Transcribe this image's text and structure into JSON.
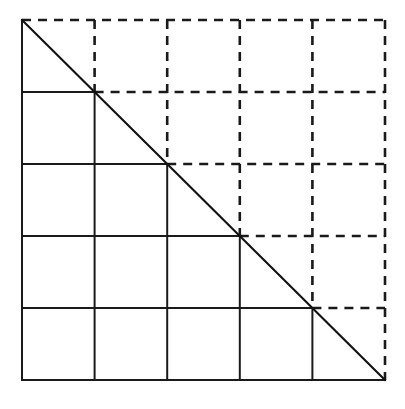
{
  "figure": {
    "kind": "geometric-diagram",
    "canvas": {
      "width": 405,
      "height": 409,
      "background": "#ffffff"
    },
    "square": {
      "x0": 22,
      "y0": 20,
      "x1": 385,
      "y1": 380,
      "width": 363,
      "height": 360
    },
    "grid": {
      "rows": 5,
      "columns": 5,
      "x_positions": [
        22,
        94.6,
        167.2,
        239.8,
        312.4,
        385
      ],
      "y_positions": [
        20,
        92,
        164,
        236,
        308,
        380
      ],
      "cell_width": 72.6,
      "cell_height": 72
    },
    "diagonal": {
      "name": "anti-diagonal",
      "from": [
        22,
        20
      ],
      "to": [
        385,
        380
      ],
      "style": "solid",
      "color": "#111111",
      "width": 2.1
    },
    "styles": {
      "solid": {
        "label": "solid",
        "color": "#1a1a1a",
        "width": 2.0,
        "dash": "none"
      },
      "dashed": {
        "label": "dashed",
        "color": "#1a1a1a",
        "width": 2.6,
        "dash": "9 7"
      }
    },
    "rule": "Segments on or below-left of the anti-diagonal are drawn solid; segments above-right of the anti-diagonal are drawn dashed.",
    "edges": {
      "left": "solid",
      "bottom": "solid",
      "top": "dashed",
      "right": "dashed"
    },
    "vertical_lines": [
      {
        "x": 22,
        "solid_from_y": 20,
        "solid_to_y": 380,
        "dashed_from_y": null,
        "dashed_to_y": null
      },
      {
        "x": 94.6,
        "solid_from_y": 92,
        "solid_to_y": 380,
        "dashed_from_y": 20,
        "dashed_to_y": 92
      },
      {
        "x": 167.2,
        "solid_from_y": 164,
        "solid_to_y": 380,
        "dashed_from_y": 20,
        "dashed_to_y": 164
      },
      {
        "x": 239.8,
        "solid_from_y": 236,
        "solid_to_y": 380,
        "dashed_from_y": 20,
        "dashed_to_y": 236
      },
      {
        "x": 312.4,
        "solid_from_y": 308,
        "solid_to_y": 380,
        "dashed_from_y": 20,
        "dashed_to_y": 308
      },
      {
        "x": 385,
        "solid_from_y": null,
        "solid_to_y": null,
        "dashed_from_y": 20,
        "dashed_to_y": 380
      }
    ],
    "horizontal_lines": [
      {
        "y": 20,
        "solid_from_x": null,
        "solid_to_x": null,
        "dashed_from_x": 22,
        "dashed_to_x": 385
      },
      {
        "y": 92,
        "solid_from_x": 22,
        "solid_to_x": 94.6,
        "dashed_from_x": 94.6,
        "dashed_to_x": 385
      },
      {
        "y": 164,
        "solid_from_x": 22,
        "solid_to_x": 167.2,
        "dashed_from_x": 167.2,
        "dashed_to_x": 385
      },
      {
        "y": 236,
        "solid_from_x": 22,
        "solid_to_x": 239.8,
        "dashed_from_x": 239.8,
        "dashed_to_x": 385
      },
      {
        "y": 308,
        "solid_from_x": 22,
        "solid_to_x": 312.4,
        "dashed_from_x": 312.4,
        "dashed_to_x": 385
      },
      {
        "y": 380,
        "solid_from_x": 22,
        "solid_to_x": 385,
        "dashed_from_x": null,
        "dashed_to_x": null
      }
    ]
  }
}
